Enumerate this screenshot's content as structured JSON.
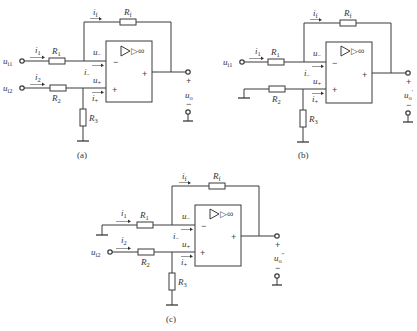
{
  "figure": {
    "panels": [
      {
        "id": "a",
        "caption": "(a)",
        "inputs": [
          {
            "label": "u",
            "sub": "i1",
            "current": "i",
            "current_sub": "1",
            "resistor": "R",
            "resistor_sub": "1",
            "source": "terminal"
          },
          {
            "label": "u",
            "sub": "i2",
            "current": "i",
            "current_sub": "2",
            "resistor": "R",
            "resistor_sub": "2",
            "source": "terminal"
          }
        ],
        "feedback": {
          "current": "i",
          "current_sub": "f",
          "resistor": "R",
          "resistor_sub": "f"
        },
        "opamp": {
          "symbol": "▷∞",
          "minus_sign": "−",
          "plus_sign": "+",
          "out_sign": "+"
        },
        "node_labels": {
          "u_minus": "u",
          "u_minus_sub": "−",
          "i_minus": "i",
          "i_minus_sub": "−",
          "u_plus": "u",
          "u_plus_sub": "+",
          "i_plus": "i",
          "i_plus_sub": "+"
        },
        "shunt": {
          "resistor": "R",
          "resistor_sub": "3"
        },
        "output": {
          "label": "u",
          "sub": "o",
          "sup": "",
          "plus": "+",
          "minus": "−"
        }
      },
      {
        "id": "b",
        "caption": "(b)",
        "inputs": [
          {
            "label": "u",
            "sub": "i1",
            "current": "i",
            "current_sub": "1",
            "resistor": "R",
            "resistor_sub": "1",
            "source": "terminal"
          },
          {
            "label": "",
            "sub": "",
            "current": "",
            "current_sub": "",
            "resistor": "R",
            "resistor_sub": "2",
            "source": "ground"
          }
        ],
        "feedback": {
          "current": "i",
          "current_sub": "f",
          "resistor": "R",
          "resistor_sub": "f"
        },
        "opamp": {
          "symbol": "▷∞",
          "minus_sign": "−",
          "plus_sign": "+",
          "out_sign": "+"
        },
        "node_labels": {
          "u_minus": "u",
          "u_minus_sub": "−",
          "i_minus": "i",
          "i_minus_sub": "−",
          "u_plus": "u",
          "u_plus_sub": "+",
          "i_plus": "i",
          "i_plus_sub": "+"
        },
        "shunt": {
          "resistor": "R",
          "resistor_sub": "3"
        },
        "output": {
          "label": "u",
          "sub": "o",
          "sup": "′",
          "plus": "+",
          "minus": "−"
        }
      },
      {
        "id": "c",
        "caption": "(c)",
        "inputs": [
          {
            "label": "",
            "sub": "",
            "current": "i",
            "current_sub": "1",
            "resistor": "R",
            "resistor_sub": "1",
            "source": "ground"
          },
          {
            "label": "u",
            "sub": "i2",
            "current": "i",
            "current_sub": "2",
            "resistor": "R",
            "resistor_sub": "2",
            "source": "terminal"
          }
        ],
        "feedback": {
          "current": "i",
          "current_sub": "f",
          "resistor": "R",
          "resistor_sub": "f"
        },
        "opamp": {
          "symbol": "▷∞",
          "minus_sign": "−",
          "plus_sign": "+",
          "out_sign": "+"
        },
        "node_labels": {
          "u_minus": "u",
          "u_minus_sub": "−",
          "i_minus": "i",
          "i_minus_sub": "−",
          "u_plus": "u",
          "u_plus_sub": "+",
          "i_plus": "i",
          "i_plus_sub": "+"
        },
        "shunt": {
          "resistor": "R",
          "resistor_sub": "3"
        },
        "output": {
          "label": "u",
          "sub": "o",
          "sup": "″",
          "plus": "+",
          "minus": "−"
        }
      }
    ]
  }
}
